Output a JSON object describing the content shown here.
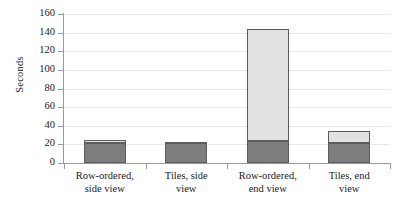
{
  "chart_data": {
    "type": "bar",
    "subtype": "stacked-bar",
    "title": "",
    "xlabel": "",
    "ylabel": "Seconds",
    "ylim": [
      0,
      160
    ],
    "yticks": [
      0,
      20,
      40,
      60,
      80,
      100,
      120,
      140,
      160
    ],
    "ytick_labels": [
      "0",
      "20",
      "40",
      "60",
      "80",
      "100",
      "120",
      "140",
      "160"
    ],
    "grid": true,
    "grid_axis": "y",
    "legend": false,
    "legend_position": "none",
    "categories": [
      "Row-ordered, side view",
      "Tiles, side view",
      "Row-ordered, end view",
      "Tiles, end view"
    ],
    "category_lines": [
      [
        "Row-ordered,",
        "side view"
      ],
      [
        "Tiles, side",
        "view"
      ],
      [
        "Row-ordered,",
        "end view"
      ],
      [
        "Tiles, end",
        "view"
      ]
    ],
    "series": [
      {
        "name": "lower-segment",
        "color": "#7d7d7d",
        "values": [
          22,
          22,
          24,
          22
        ]
      },
      {
        "name": "upper-segment",
        "color": "#e2e2e2",
        "values": [
          3,
          1,
          120,
          12
        ]
      }
    ],
    "totals": [
      25,
      23,
      144,
      34
    ],
    "colors": {
      "lower": "#7d7d7d",
      "upper": "#e2e2e2",
      "bar_outline": "#5c5c5c",
      "axis": "#9a9a9a",
      "grid": "#e8e8e8",
      "text": "#1a1a1a",
      "background": "#ffffff"
    }
  }
}
